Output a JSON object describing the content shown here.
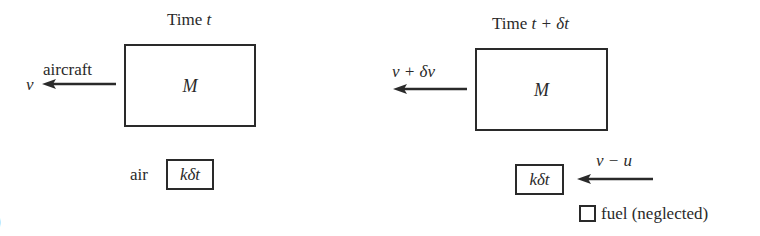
{
  "diagram": {
    "left_panel": {
      "title_prefix": "Time ",
      "title_var": "t",
      "object_label": "aircraft",
      "velocity_label": "v",
      "mass_label": "M",
      "air_label": "air",
      "air_mass_label": "kδt"
    },
    "right_panel": {
      "title_prefix": "Time ",
      "title_var": "t + δt",
      "velocity_label": "v + δv",
      "mass_label": "M",
      "air_mass_label": "kδt",
      "air_velocity_label": "v − u",
      "legend_label": "fuel (neglected)"
    },
    "cropped_glyph": ")",
    "colors": {
      "ink": "#2a2a2a",
      "background": "#ffffff"
    }
  }
}
